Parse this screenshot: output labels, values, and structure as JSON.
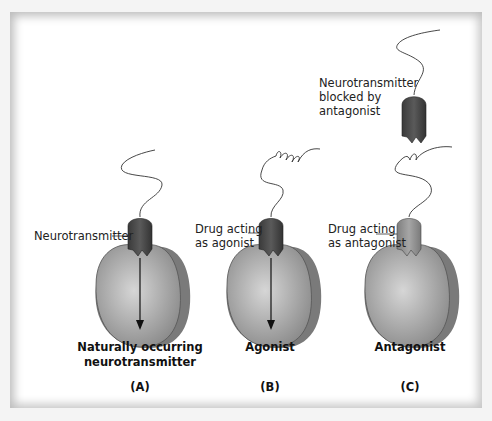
{
  "panels": [
    {
      "id": "A",
      "letter": "(A)",
      "caption_line1": "Naturally occurring",
      "caption_line2": "neurotransmitter",
      "callout": "Neurotransmitter"
    },
    {
      "id": "B",
      "letter": "(B)",
      "caption_line1": "Agonist",
      "callout_line1": "Drug acting",
      "callout_line2": "as agonist"
    },
    {
      "id": "C",
      "letter": "(C)",
      "caption_line1": "Antagonist",
      "callout_line1": "Drug acting",
      "callout_line2": "as antagonist",
      "blocked_line1": "Neurotransmitter",
      "blocked_line2": "blocked by",
      "blocked_line3": "antagonist"
    }
  ],
  "colors": {
    "receptor": "#9a9a9a",
    "receptor_light": "#c4c4c4",
    "neurotransmitter": "#4a4a4a",
    "antagonist": "#8f8f8f",
    "arrow": "#111111"
  }
}
